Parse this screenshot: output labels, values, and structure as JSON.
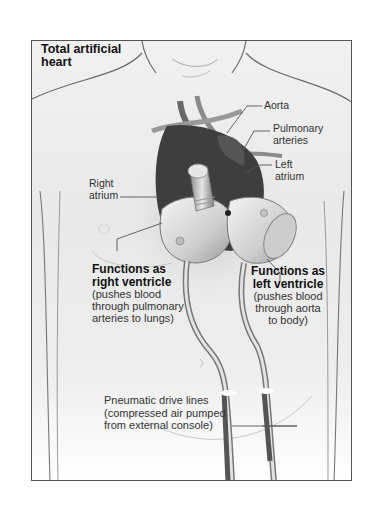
{
  "figure": {
    "title_line1": "Total artificial",
    "title_line2": "heart"
  },
  "labels": {
    "aorta": "Aorta",
    "pulmonary_arteries_1": "Pulmonary",
    "pulmonary_arteries_2": "arteries",
    "left_atrium_1": "Left",
    "left_atrium_2": "atrium",
    "right_atrium_1": "Right",
    "right_atrium_2": "atrium",
    "right_ventricle": {
      "heading_1": "Functions as",
      "heading_2": "right ventricle",
      "desc_1": "(pushes blood",
      "desc_2": "through pulmonary",
      "desc_3": "arteries to lungs)"
    },
    "left_ventricle": {
      "heading_1": "Functions as",
      "heading_2": "left ventricle",
      "desc_1": "(pushes blood",
      "desc_2": "through aorta",
      "desc_3": "to body)"
    },
    "drive_lines": {
      "line_1": "Pneumatic drive lines",
      "line_2": "(compressed air pumped",
      "line_3": "from external console)"
    }
  },
  "colors": {
    "border": "#555555",
    "body_line": "#6a6a6a",
    "heart_dark": "#3a3a3a",
    "device_light": "#dcdcdc"
  }
}
